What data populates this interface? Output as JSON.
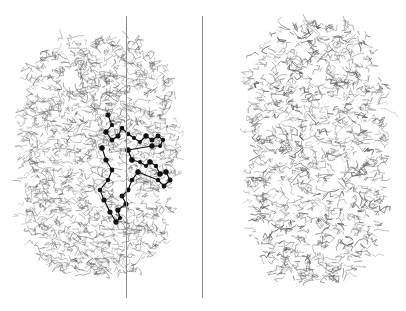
{
  "figure": {
    "background": "#ffffff",
    "panels": [
      {
        "name": "left-molecule",
        "bounds": {
          "x": 20,
          "y": 35,
          "w": 155,
          "h": 240
        },
        "wire_color": "#555555",
        "has_ligand": true,
        "ligand_color": "#111111"
      },
      {
        "name": "right-molecule",
        "bounds": {
          "x": 245,
          "y": 20,
          "w": 140,
          "h": 262
        },
        "wire_color": "#555555",
        "has_ligand": false
      }
    ],
    "lines": [
      {
        "name": "left-vertical-line",
        "x": 126,
        "y1": 16,
        "y2": 298,
        "color": "#8a8a8a"
      },
      {
        "name": "center-divider-line",
        "x": 202,
        "y1": 16,
        "y2": 298,
        "color": "#8a8a8a"
      }
    ]
  }
}
